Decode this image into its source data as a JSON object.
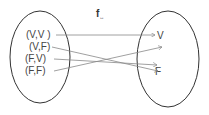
{
  "title": {
    "main": "f",
    "subscript": "↔"
  },
  "domain_set": {
    "elements": [
      "(V,V )",
      "(V,F)",
      "(F,V)",
      "(F,F)"
    ]
  },
  "codomain_set": {
    "elements": [
      "V",
      "F"
    ]
  },
  "mappings": [
    {
      "from": "(V,V )",
      "to": "V"
    },
    {
      "from": "(V,F)",
      "to": "F"
    },
    {
      "from": "(F,V)",
      "to": "F"
    },
    {
      "from": "(F,F)",
      "to": "V"
    }
  ],
  "colors": {
    "stroke": "#333333",
    "arrow": "#888888",
    "text": "#444444"
  }
}
